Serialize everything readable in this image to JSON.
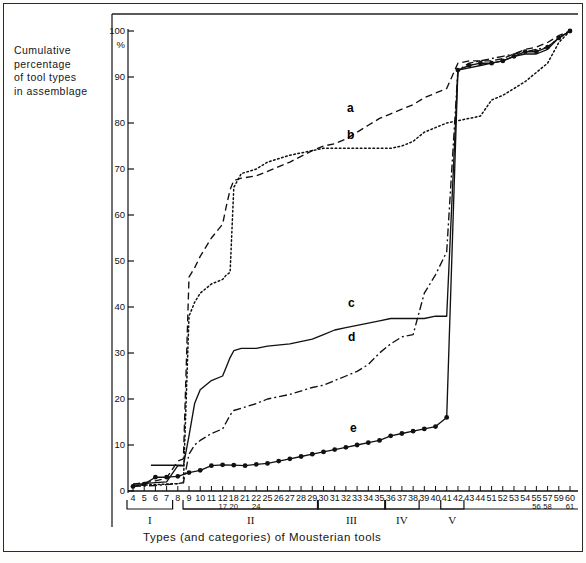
{
  "figure": {
    "y_axis_caption_lines": [
      "Cumulative",
      "percentage",
      "of tool types",
      "in assemblage"
    ],
    "x_axis_caption": "Types (and categories) of Mousterian tools",
    "percent_symbol": "%"
  },
  "chart_data": {
    "type": "line",
    "title": "",
    "xlabel": "Types (and categories) of Mousterian tools",
    "ylabel": "Cumulative percentage of tool types in assemblage",
    "ylim": [
      0,
      100
    ],
    "yticks": [
      0,
      10,
      20,
      30,
      40,
      50,
      60,
      70,
      80,
      90,
      100
    ],
    "ytick_labels": [
      "0",
      "10",
      "20",
      "30",
      "40",
      "50",
      "60",
      "70",
      "80",
      "90",
      "100"
    ],
    "grid": false,
    "legend_position": "inline-curve-labels",
    "x_tick_labels_top": [
      "4",
      "5",
      "6",
      "7",
      "8",
      "9",
      "10",
      "11",
      "12",
      "18",
      "21",
      "22",
      "25",
      "26",
      "27",
      "28",
      "29",
      "30",
      "31",
      "32",
      "33",
      "34",
      "35",
      "36",
      "37",
      "38",
      "39",
      "40",
      "41",
      "42",
      "43",
      "44",
      "51",
      "52",
      "53",
      "54",
      "55",
      "57",
      "59",
      "60"
    ],
    "x_tick_labels_bottom": [
      "17",
      "20",
      "24",
      "56",
      "58",
      "61"
    ],
    "x_tick_label_stacks": [
      {
        "top": "12",
        "bottom": "17"
      },
      {
        "top": "18",
        "bottom": "20"
      },
      {
        "top": "22",
        "bottom": "24"
      },
      {
        "top": "55",
        "bottom": "56"
      },
      {
        "top": "57",
        "bottom": "58"
      },
      {
        "top": "60",
        "bottom": "61"
      }
    ],
    "categories_brackets": [
      {
        "label": "I",
        "start_tick": "4",
        "end_tick": "7"
      },
      {
        "label": "II",
        "start_tick": "9",
        "end_tick": "29"
      },
      {
        "label": "III",
        "start_tick": "30",
        "end_tick": "35"
      },
      {
        "label": "IV",
        "start_tick": "36",
        "end_tick": "38"
      },
      {
        "label": "V",
        "start_tick": "41",
        "end_tick": "42"
      }
    ],
    "series": [
      {
        "name": "a",
        "style": "dashed",
        "label": "a",
        "x": [
          4,
          5,
          6,
          7,
          8,
          8.5,
          9,
          9.5,
          10,
          11,
          12,
          14,
          16,
          18,
          20,
          22,
          25,
          27,
          29,
          30,
          31,
          32,
          33,
          34,
          35,
          36,
          37,
          38,
          39,
          40,
          41,
          42,
          43,
          44,
          51,
          52,
          53,
          54,
          55,
          57,
          59,
          60
        ],
        "y": [
          1.5,
          1.8,
          2.2,
          2.8,
          6.5,
          7.0,
          46.5,
          48.5,
          51,
          55,
          58,
          62,
          65.5,
          67.5,
          68,
          68.5,
          69.5,
          71.5,
          74,
          75,
          75.5,
          76.5,
          78,
          79.5,
          81,
          82,
          83,
          84,
          85.5,
          86.5,
          87.5,
          93,
          93.5,
          93.5,
          93.5,
          94,
          95,
          96,
          96.5,
          97.5,
          99,
          100
        ]
      },
      {
        "name": "b",
        "style": "dotted",
        "label": "b",
        "x": [
          4,
          5,
          6,
          7,
          8,
          8.5,
          9,
          9.5,
          10,
          11,
          12,
          14,
          16,
          18,
          20,
          22,
          25,
          27,
          29,
          30,
          31,
          32,
          33,
          34,
          35,
          36,
          37,
          38,
          39,
          40,
          41,
          42,
          43,
          44,
          51,
          52,
          53,
          54,
          55,
          57,
          59,
          60
        ],
        "y": [
          1.2,
          1.3,
          1.4,
          1.5,
          1.6,
          1.8,
          38,
          41,
          43,
          45,
          46,
          47,
          47.5,
          66,
          69,
          70,
          71.5,
          73,
          74,
          74.5,
          74.5,
          74.5,
          74.5,
          74.5,
          74.5,
          74.5,
          75,
          76,
          78,
          79,
          80,
          80.5,
          81,
          81.5,
          85,
          86,
          87.5,
          89,
          91,
          93,
          97.5,
          100
        ]
      },
      {
        "name": "c",
        "style": "solid",
        "label": "c",
        "x": [
          4,
          5,
          6,
          7,
          8,
          8.5,
          9,
          9.5,
          10,
          11,
          12,
          14,
          16,
          18,
          20,
          22,
          25,
          27,
          29,
          30,
          31,
          32,
          33,
          34,
          35,
          36,
          37,
          38,
          39,
          40,
          41,
          42,
          43,
          44,
          51,
          52,
          53,
          54,
          55,
          57,
          59,
          60
        ],
        "y": [
          1.5,
          1.6,
          1.8,
          2.0,
          5.5,
          5.5,
          12,
          19,
          22,
          24,
          25,
          27,
          29,
          30.5,
          31,
          31,
          31.5,
          32,
          33,
          34,
          35,
          35.5,
          36,
          36.5,
          37,
          37.5,
          37.5,
          37.5,
          37.5,
          38,
          38,
          91.5,
          92,
          92.5,
          93,
          93.5,
          94.5,
          95,
          95,
          96,
          98.5,
          100
        ]
      },
      {
        "name": "d",
        "style": "dash-dot",
        "label": "d",
        "x": [
          4,
          5,
          6,
          7,
          8,
          8.5,
          9,
          9.5,
          10,
          11,
          12,
          14,
          16,
          18,
          20,
          22,
          25,
          27,
          29,
          30,
          31,
          32,
          33,
          34,
          35,
          36,
          37,
          38,
          39,
          40,
          41,
          42,
          43,
          44,
          51,
          52,
          53,
          54,
          55,
          57,
          59,
          60
        ],
        "y": [
          1.0,
          1.1,
          1.2,
          1.4,
          1.6,
          1.8,
          8,
          10,
          11,
          12.5,
          13.5,
          15,
          16.5,
          17.5,
          18,
          19,
          20,
          21,
          22.5,
          23,
          24,
          25,
          26,
          27.5,
          30,
          32,
          33.5,
          34,
          43,
          47,
          52,
          91.5,
          93,
          93.5,
          94,
          94.5,
          95,
          95.5,
          96,
          96.5,
          98.5,
          100
        ]
      },
      {
        "name": "e",
        "style": "solid-markers",
        "label": "e",
        "x": [
          4,
          5,
          6,
          7,
          8,
          9,
          10,
          11,
          12,
          18,
          21,
          22,
          25,
          26,
          27,
          28,
          29,
          30,
          31,
          32,
          33,
          34,
          35,
          36,
          37,
          38,
          39,
          40,
          41,
          42,
          43,
          44,
          51,
          52,
          53,
          54,
          55,
          57,
          59,
          60
        ],
        "y": [
          1.0,
          1.5,
          3.0,
          3.0,
          3.2,
          4.0,
          4.5,
          5.5,
          5.7,
          5.6,
          5.5,
          5.8,
          6.0,
          6.5,
          7.0,
          7.5,
          8.0,
          8.5,
          9.0,
          9.5,
          10.0,
          10.5,
          11.0,
          12.0,
          12.5,
          13.0,
          13.5,
          14.0,
          16.0,
          91.5,
          92.5,
          93.0,
          93.0,
          93.5,
          94.5,
          95.5,
          95.5,
          96.5,
          98.5,
          100
        ]
      }
    ]
  }
}
